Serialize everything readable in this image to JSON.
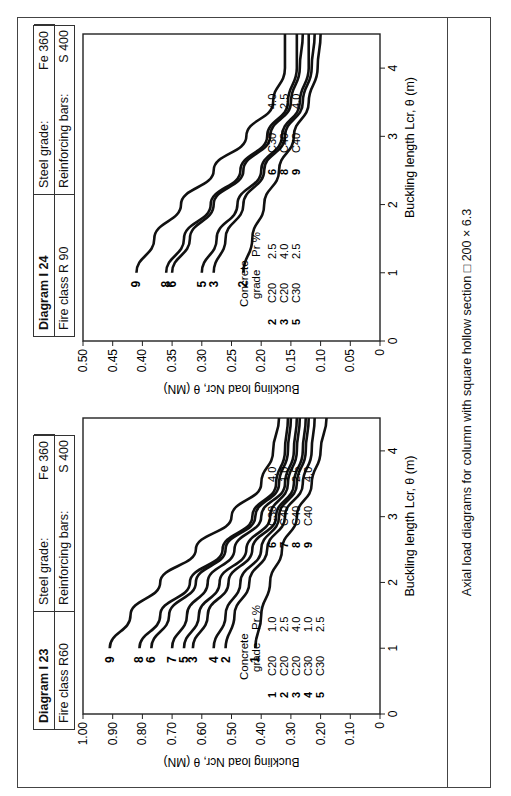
{
  "caption": "Axial load diagrams for column with square hollow section □ 200 × 6.3",
  "diagrams": [
    {
      "id": "I23",
      "title": "Diagram  I 23",
      "fire_class": "Fire class  R60",
      "steel_label": "Steel grade:",
      "steel_value": "Fe 360",
      "bars_label": "Reinforcing bars:",
      "bars_value": "S 400"
    },
    {
      "id": "I24",
      "title": "Diagram  I 24",
      "fire_class": "Fire class R 90",
      "steel_label": "Steel grade:",
      "steel_value": "Fe 360",
      "bars_label": "Reinforcing bars:",
      "bars_value": "S 400"
    }
  ],
  "chart_data": [
    {
      "type": "line",
      "title": "Diagram I 23 — Fire class R60",
      "xlabel": "Buckling length Lcr, θ (m)",
      "ylabel": "Buckling load Ncr, θ (MN)",
      "xlim": [
        0,
        4.5
      ],
      "ylim": [
        0,
        1.0
      ],
      "xticks": [
        "0",
        "1",
        "2",
        "3",
        "4"
      ],
      "yticks": [
        "0",
        "0.10",
        "0.20",
        "0.30",
        "0.40",
        "0.50",
        "0.60",
        "0.70",
        "0.80",
        "0.90",
        "1.00"
      ],
      "grid": false,
      "legend_header": {
        "concrete": "Concrete grade",
        "pr": "Pr %"
      },
      "legend": [
        {
          "id": "1",
          "concrete": "C20",
          "pr": "1.0"
        },
        {
          "id": "2",
          "concrete": "C20",
          "pr": "2.5"
        },
        {
          "id": "3",
          "concrete": "C20",
          "pr": "4.0"
        },
        {
          "id": "4",
          "concrete": "C30",
          "pr": "1.0"
        },
        {
          "id": "5",
          "concrete": "C30",
          "pr": "2.5"
        },
        {
          "id": "6",
          "concrete": "C30",
          "pr": "4.0"
        },
        {
          "id": "7",
          "concrete": "C40",
          "pr": "1.0"
        },
        {
          "id": "8",
          "concrete": "C40",
          "pr": "2.5"
        },
        {
          "id": "9",
          "concrete": "C40",
          "pr": "4.0"
        }
      ],
      "x": [
        1.0,
        1.5,
        2.0,
        2.5,
        3.0,
        3.5,
        4.0,
        4.5
      ],
      "series": [
        {
          "name": "1",
          "values": [
            0.42,
            0.4,
            0.37,
            0.33,
            0.28,
            0.23,
            0.2,
            0.18
          ]
        },
        {
          "name": "2",
          "values": [
            0.52,
            0.49,
            0.44,
            0.38,
            0.32,
            0.26,
            0.23,
            0.22
          ]
        },
        {
          "name": "4",
          "values": [
            0.56,
            0.52,
            0.47,
            0.4,
            0.34,
            0.28,
            0.25,
            0.24
          ]
        },
        {
          "name": "3",
          "values": [
            0.63,
            0.58,
            0.51,
            0.43,
            0.35,
            0.29,
            0.26,
            0.25
          ]
        },
        {
          "name": "5",
          "values": [
            0.66,
            0.61,
            0.54,
            0.45,
            0.37,
            0.31,
            0.28,
            0.27
          ]
        },
        {
          "name": "7",
          "values": [
            0.7,
            0.65,
            0.58,
            0.49,
            0.4,
            0.32,
            0.29,
            0.28
          ]
        },
        {
          "name": "6",
          "values": [
            0.77,
            0.71,
            0.62,
            0.52,
            0.42,
            0.34,
            0.31,
            0.3
          ]
        },
        {
          "name": "8",
          "values": [
            0.81,
            0.74,
            0.64,
            0.53,
            0.43,
            0.35,
            0.32,
            0.31
          ]
        },
        {
          "name": "9",
          "values": [
            0.91,
            0.84,
            0.74,
            0.62,
            0.5,
            0.4,
            0.36,
            0.34
          ]
        }
      ]
    },
    {
      "type": "line",
      "title": "Diagram I 24 — Fire class R 90",
      "xlabel": "Buckling length Lcr, θ (m)",
      "ylabel": "Buckling load Ncr, θ (MN)",
      "xlim": [
        0,
        4.5
      ],
      "ylim": [
        0,
        0.5
      ],
      "xticks": [
        "0",
        "1",
        "2",
        "3",
        "4"
      ],
      "yticks": [
        "0",
        "0.05",
        "0.10",
        "0.15",
        "0.20",
        "0.25",
        "0.30",
        "0.35",
        "0.40",
        "0.45",
        "0.50"
      ],
      "grid": false,
      "legend_header": {
        "concrete": "Concrete grade",
        "pr": "Pr %"
      },
      "legend": [
        {
          "id": "2",
          "concrete": "C20",
          "pr": "2.5"
        },
        {
          "id": "3",
          "concrete": "C20",
          "pr": "4.0"
        },
        {
          "id": "5",
          "concrete": "C30",
          "pr": "2.5"
        },
        {
          "id": "6",
          "concrete": "C30",
          "pr": "4.0"
        },
        {
          "id": "8",
          "concrete": "C40",
          "pr": "2.5"
        },
        {
          "id": "9",
          "concrete": "C40",
          "pr": "4.0"
        }
      ],
      "x": [
        1.0,
        1.5,
        2.0,
        2.5,
        3.0,
        3.5,
        4.0,
        4.5
      ],
      "series": [
        {
          "name": "2",
          "values": [
            0.23,
            0.215,
            0.195,
            0.17,
            0.145,
            0.12,
            0.105,
            0.1
          ]
        },
        {
          "name": "3",
          "values": [
            0.28,
            0.26,
            0.23,
            0.195,
            0.16,
            0.13,
            0.115,
            0.11
          ]
        },
        {
          "name": "5",
          "values": [
            0.3,
            0.275,
            0.24,
            0.2,
            0.165,
            0.135,
            0.12,
            0.12
          ]
        },
        {
          "name": "6",
          "values": [
            0.35,
            0.32,
            0.28,
            0.23,
            0.185,
            0.15,
            0.135,
            0.13
          ]
        },
        {
          "name": "8",
          "values": [
            0.36,
            0.33,
            0.285,
            0.235,
            0.19,
            0.155,
            0.14,
            0.14
          ]
        },
        {
          "name": "9",
          "values": [
            0.41,
            0.38,
            0.335,
            0.28,
            0.225,
            0.18,
            0.16,
            0.16
          ]
        }
      ]
    }
  ]
}
